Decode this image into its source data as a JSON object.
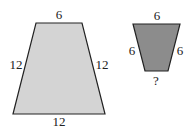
{
  "large_trapezoid": {
    "top": "6",
    "left": "12",
    "right": "12",
    "bottom": "12",
    "fill": "#d4d4d4"
  },
  "small_trapezoid": {
    "top": "6",
    "left": "6",
    "right": "6",
    "bottom": "?",
    "fill": "#8c8c8c"
  },
  "stroke": "#222222"
}
